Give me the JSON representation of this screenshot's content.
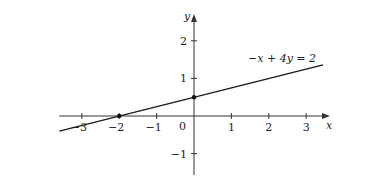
{
  "chart_data": {
    "type": "line",
    "title": "",
    "xlabel": "x",
    "ylabel": "y",
    "xlim": [
      -3.6,
      3.6
    ],
    "ylim": [
      -1.6,
      2.6
    ],
    "grid": false,
    "x_ticks": [
      -3,
      -2,
      -1,
      1,
      2,
      3
    ],
    "y_ticks": [
      -1,
      1,
      2
    ],
    "origin_label": "0",
    "series": [
      {
        "name": "-x + 4y = 2",
        "equation": "-x + 4y = 2",
        "slope": 0.25,
        "intercept": 0.5,
        "x": [
          -3.6,
          3.45
        ],
        "values": [
          -0.4,
          1.3625
        ]
      }
    ],
    "points": [
      {
        "x": -2,
        "y": 0,
        "label": "x-intercept"
      },
      {
        "x": 0,
        "y": 0.5,
        "label": "y-intercept"
      }
    ],
    "annotations": [
      {
        "text": "−x + 4y = 2",
        "x": 2.7,
        "y": 1.55
      }
    ]
  },
  "colors": {
    "axis": "#333333",
    "line": "#1a1a1a",
    "point": "#111111",
    "background": "#ffffff"
  }
}
